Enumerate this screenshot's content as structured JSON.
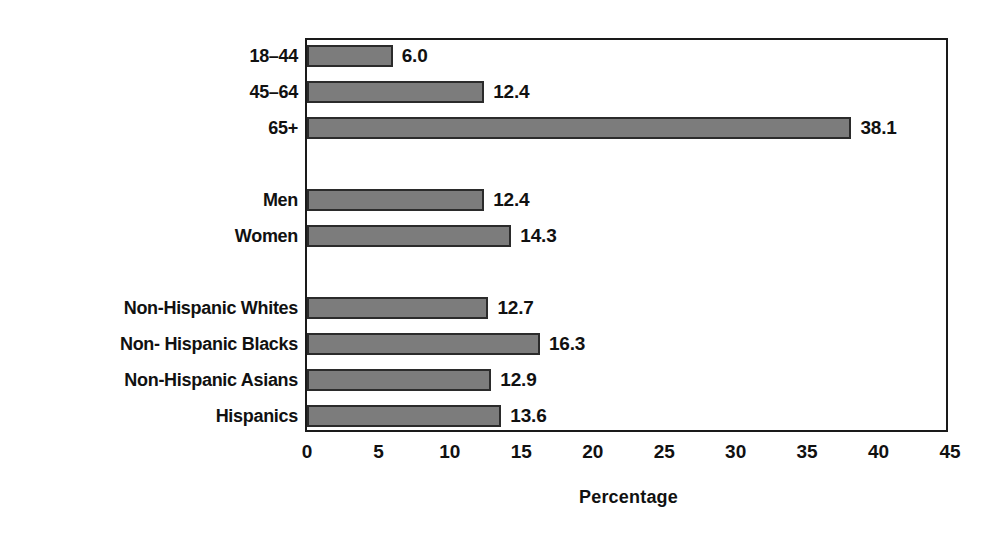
{
  "chart_data": {
    "type": "bar",
    "orientation": "horizontal",
    "title": "",
    "xlabel": "Percentage",
    "ylabel": "",
    "xlim": [
      0,
      45
    ],
    "xticks": [
      0,
      5,
      10,
      15,
      20,
      25,
      30,
      35,
      40,
      45
    ],
    "xtick_labels": [
      "0",
      "5",
      "10",
      "15",
      "20",
      "25",
      "30",
      "35",
      "40",
      "45"
    ],
    "grid": false,
    "legend": "none",
    "bar_color": "#7c7c7c",
    "bar_edge_color": "#2b2b2b",
    "categories": [
      "18–44",
      "45–64",
      "65+",
      "Men",
      "Women",
      "Non-Hispanic Whites",
      "Non- Hispanic Blacks",
      "Non-Hispanic Asians",
      "Hispanics"
    ],
    "values": [
      6.0,
      12.4,
      38.1,
      12.4,
      14.3,
      12.7,
      16.3,
      12.9,
      13.6
    ],
    "value_labels": [
      "6.0",
      "12.4",
      "38.1",
      "12.4",
      "14.3",
      "12.7",
      "16.3",
      "12.9",
      "13.6"
    ],
    "groups": [
      {
        "name": "Age",
        "categories": [
          "18–44",
          "45–64",
          "65+"
        ]
      },
      {
        "name": "Sex",
        "categories": [
          "Men",
          "Women"
        ]
      },
      {
        "name": "Race and ethnicity",
        "categories": [
          "Non-Hispanic Whites",
          "Non- Hispanic Blacks",
          "Non-Hispanic Asians",
          "Hispanics"
        ]
      }
    ],
    "bars": [
      {
        "label": "18–44",
        "value": 6.0,
        "value_label": "6.0",
        "row": 0
      },
      {
        "label": "45–64",
        "value": 12.4,
        "value_label": "12.4",
        "row": 1
      },
      {
        "label": "65+",
        "value": 38.1,
        "value_label": "38.1",
        "row": 2
      },
      {
        "label": "Men",
        "value": 12.4,
        "value_label": "12.4",
        "row": 4
      },
      {
        "label": "Women",
        "value": 14.3,
        "value_label": "14.3",
        "row": 5
      },
      {
        "label": "Non-Hispanic Whites",
        "value": 12.7,
        "value_label": "12.7",
        "row": 7
      },
      {
        "label": "Non- Hispanic Blacks",
        "value": 16.3,
        "value_label": "16.3",
        "row": 8
      },
      {
        "label": "Non-Hispanic Asians",
        "value": 12.9,
        "value_label": "12.9",
        "row": 9
      },
      {
        "label": "Hispanics",
        "value": 13.6,
        "value_label": "13.6",
        "row": 10
      }
    ]
  }
}
